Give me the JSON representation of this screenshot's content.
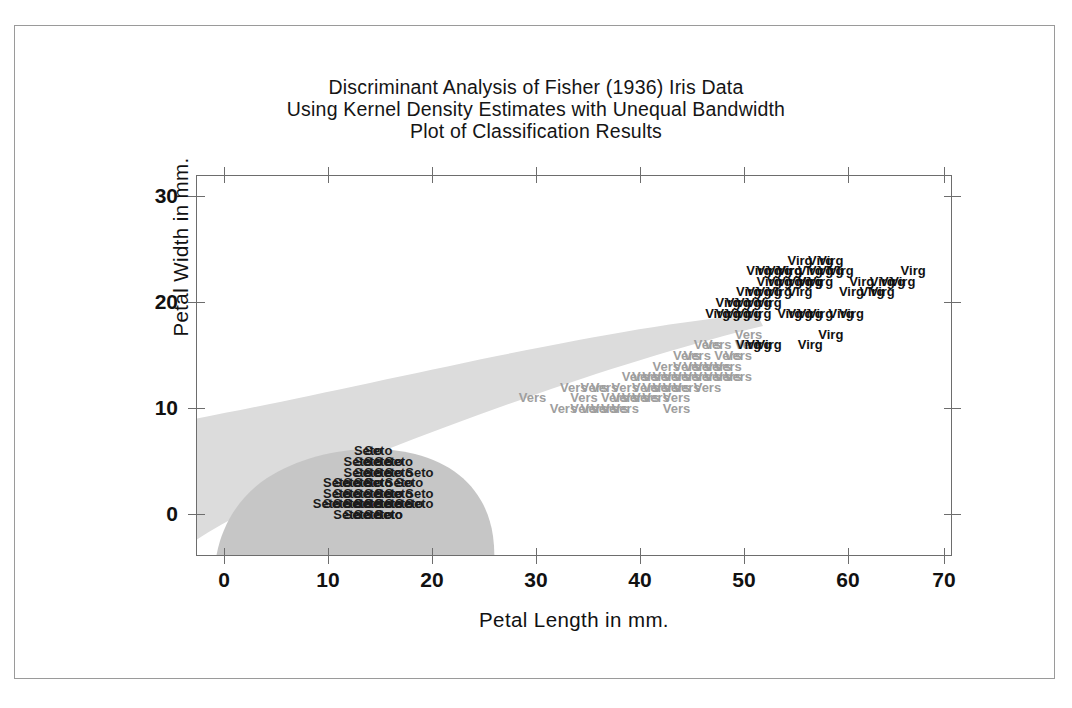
{
  "title": {
    "line1": "Discriminant Analysis of Fisher (1936) Iris Data",
    "line2": "Using Kernel Density Estimates with Unequal Bandwidth",
    "line3": "Plot of Classification Results"
  },
  "chart_data": {
    "type": "scatter",
    "xlabel": "Petal Length in mm.",
    "ylabel": "Petal Width in mm.",
    "xlim": [
      -3,
      73
    ],
    "ylim": [
      -4,
      32
    ],
    "xticks": [
      0,
      10,
      20,
      30,
      40,
      50,
      60,
      70
    ],
    "yticks": [
      0,
      10,
      20,
      30
    ],
    "grid": false,
    "legend": "none",
    "marker_style": "text-labels",
    "colors": {
      "setosa_label": "#1b1b1b",
      "versicolor_label": "#9e9e9e",
      "virginica_label": "#111111",
      "region_light": "#dcdcdc",
      "region_dark": "#c6c6c6",
      "axis": "#6d6d6d",
      "page_border": "#9a9a9a",
      "background": "#ffffff"
    },
    "regions": [
      {
        "name": "versicolor-classification-region",
        "fill": "#dcdcdc",
        "description": "Light gray wedge fanning from lower-left to a point near (53, 16)"
      },
      {
        "name": "setosa-classification-region",
        "fill": "#c6c6c6",
        "description": "Darker gray rounded blob centered near (13, 2) spanning roughly x 0-26, y -4 to 9"
      }
    ],
    "series": [
      {
        "name": "Setosa",
        "label_text": "Seto",
        "color": "#1b1b1b",
        "points": [
          [
            14,
            4
          ],
          [
            15,
            4
          ],
          [
            15,
            3
          ],
          [
            13,
            3
          ],
          [
            15,
            3
          ],
          [
            17,
            3
          ],
          [
            14,
            3
          ],
          [
            14,
            2
          ],
          [
            15,
            2
          ],
          [
            16,
            2
          ],
          [
            17,
            2
          ],
          [
            12,
            2
          ],
          [
            13,
            2
          ],
          [
            16,
            2
          ],
          [
            11,
            1
          ],
          [
            12,
            1
          ],
          [
            13,
            1
          ],
          [
            14,
            1
          ],
          [
            15,
            1
          ],
          [
            16,
            1
          ],
          [
            17,
            1
          ],
          [
            18,
            1
          ],
          [
            13,
            1
          ],
          [
            14,
            1
          ],
          [
            15,
            1
          ],
          [
            16,
            1
          ],
          [
            12,
            0
          ],
          [
            14,
            0
          ],
          [
            15,
            0
          ],
          [
            16,
            0
          ],
          [
            13,
            0
          ],
          [
            10,
            1
          ],
          [
            11,
            2
          ],
          [
            19,
            2
          ],
          [
            19,
            4
          ],
          [
            16,
            5
          ],
          [
            14,
            5
          ],
          [
            15,
            6
          ],
          [
            13,
            4
          ],
          [
            17,
            4
          ],
          [
            12,
            3
          ],
          [
            18,
            3
          ],
          [
            16,
            4
          ],
          [
            14,
            6
          ],
          [
            15,
            5
          ],
          [
            13,
            5
          ],
          [
            17,
            5
          ],
          [
            11,
            3
          ],
          [
            19,
            1
          ],
          [
            16,
            0
          ]
        ]
      },
      {
        "name": "Versicolor",
        "label_text": "Vers",
        "color": "#9e9e9e",
        "points": [
          [
            47,
            14
          ],
          [
            45,
            15
          ],
          [
            49,
            15
          ],
          [
            46,
            15
          ],
          [
            47,
            16
          ],
          [
            48,
            14
          ],
          [
            44,
            13
          ],
          [
            43,
            13
          ],
          [
            45,
            13
          ],
          [
            47,
            13
          ],
          [
            48,
            13
          ],
          [
            49,
            13
          ],
          [
            40,
            13
          ],
          [
            41,
            13
          ],
          [
            42,
            13
          ],
          [
            46,
            13
          ],
          [
            50,
            13
          ],
          [
            39,
            12
          ],
          [
            41,
            12
          ],
          [
            42,
            12
          ],
          [
            43,
            12
          ],
          [
            44,
            12
          ],
          [
            45,
            12
          ],
          [
            47,
            12
          ],
          [
            35,
            11
          ],
          [
            38,
            11
          ],
          [
            39,
            11
          ],
          [
            40,
            11
          ],
          [
            41,
            11
          ],
          [
            42,
            11
          ],
          [
            44,
            11
          ],
          [
            33,
            10
          ],
          [
            36,
            10
          ],
          [
            37,
            10
          ],
          [
            38,
            10
          ],
          [
            35,
            10
          ],
          [
            39,
            10
          ],
          [
            30,
            11
          ],
          [
            34,
            12
          ],
          [
            46,
            14
          ],
          [
            48,
            16
          ],
          [
            50,
            15
          ],
          [
            51,
            16
          ],
          [
            45,
            14
          ],
          [
            43,
            14
          ],
          [
            49,
            14
          ],
          [
            51,
            17
          ],
          [
            36,
            12
          ],
          [
            37,
            12
          ],
          [
            44,
            10
          ]
        ]
      },
      {
        "name": "Virginica",
        "label_text": "Virg",
        "color": "#111111",
        "points": [
          [
            56,
            24
          ],
          [
            58,
            24
          ],
          [
            59,
            24
          ],
          [
            55,
            23
          ],
          [
            57,
            23
          ],
          [
            53,
            23
          ],
          [
            54,
            23
          ],
          [
            55,
            23
          ],
          [
            58,
            23
          ],
          [
            59,
            23
          ],
          [
            60,
            23
          ],
          [
            67,
            23
          ],
          [
            52,
            23
          ],
          [
            56,
            22
          ],
          [
            57,
            22
          ],
          [
            62,
            22
          ],
          [
            64,
            22
          ],
          [
            66,
            22
          ],
          [
            53,
            22
          ],
          [
            54,
            22
          ],
          [
            55,
            22
          ],
          [
            57,
            22
          ],
          [
            58,
            22
          ],
          [
            65,
            22
          ],
          [
            51,
            21
          ],
          [
            52,
            21
          ],
          [
            53,
            21
          ],
          [
            54,
            21
          ],
          [
            56,
            21
          ],
          [
            61,
            21
          ],
          [
            63,
            21
          ],
          [
            64,
            21
          ],
          [
            50,
            20
          ],
          [
            51,
            20
          ],
          [
            52,
            20
          ],
          [
            53,
            20
          ],
          [
            49,
            20
          ],
          [
            50,
            19
          ],
          [
            51,
            19
          ],
          [
            52,
            19
          ],
          [
            55,
            19
          ],
          [
            48,
            19
          ],
          [
            49,
            19
          ],
          [
            56,
            19
          ],
          [
            57,
            19
          ],
          [
            58,
            19
          ],
          [
            60,
            19
          ],
          [
            61,
            19
          ],
          [
            59,
            17
          ],
          [
            57,
            16
          ],
          [
            51,
            16
          ],
          [
            52,
            16
          ],
          [
            53,
            16
          ]
        ]
      }
    ]
  },
  "axes": {
    "x": {
      "title": "Petal Length in mm.",
      "ticks": [
        "0",
        "10",
        "20",
        "30",
        "40",
        "50",
        "60",
        "70"
      ]
    },
    "y": {
      "title": "Petal Width in mm.",
      "ticks": [
        "30",
        "20",
        "10",
        "0"
      ]
    }
  }
}
